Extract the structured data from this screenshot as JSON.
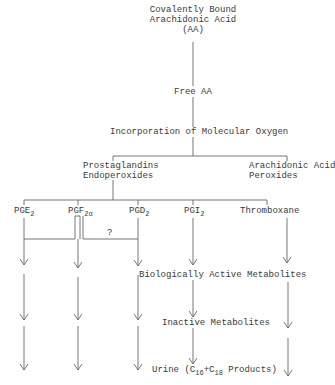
{
  "diagram": {
    "root": {
      "line1": "Covalently Bound",
      "line2": "Arachidonic Acid",
      "line3": "(AA)"
    },
    "free_aa": "Free AA",
    "oxygen": "Incorporation of Molecular Oxygen",
    "branches": {
      "left": {
        "line1": "Prostaglandins",
        "line2": "Endoperoxides"
      },
      "right": {
        "line1": "Arachidonic Acid",
        "line2": "Peroxides"
      }
    },
    "products": [
      {
        "base": "PGE",
        "sub": "2"
      },
      {
        "base": "PGF",
        "sub": "2α"
      },
      {
        "base": "PGD",
        "sub": "2"
      },
      {
        "base": "PGI",
        "sub": "2"
      },
      {
        "base": "Thromboxane",
        "sub": ""
      }
    ],
    "question_mark": "?",
    "bio_active": "Biologically Active Metabolites",
    "inactive": "Inactive Metabolites",
    "urine": {
      "prefix": "Urine (C",
      "sub1": "16",
      "mid": "+C",
      "sub2": "18",
      "suffix": " Products)"
    },
    "line_color": "#555555"
  }
}
